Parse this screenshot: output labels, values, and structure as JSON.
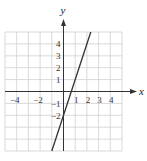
{
  "chart_data": {
    "type": "line",
    "title": "",
    "xlabel": "x",
    "ylabel": "y",
    "xlim": [
      -5,
      5
    ],
    "ylim": [
      -5,
      5
    ],
    "grid": true,
    "x_tick_labels": [
      "-4",
      "-2",
      "1",
      "2",
      "3",
      "4"
    ],
    "x_ticks": [
      -4,
      -2,
      1,
      2,
      3,
      4
    ],
    "y_tick_labels": [
      "4",
      "3",
      "2",
      "1",
      "-1",
      "-2"
    ],
    "y_ticks": [
      4,
      3,
      2,
      1,
      -1,
      -2
    ],
    "series": [
      {
        "name": "y = 3x - 2",
        "equation": "y = 3x - 2",
        "slope": 3,
        "intercept": -2,
        "x": [
          -1,
          2.333
        ],
        "y": [
          -5,
          5
        ],
        "color": "#333333"
      }
    ]
  },
  "colors": {
    "grid": "#cfcfcf",
    "axis": "#333333",
    "line": "#333333"
  }
}
